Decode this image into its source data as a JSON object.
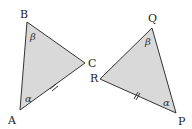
{
  "colors": {
    "fill": "#d9d9d9",
    "stroke": "#333333"
  },
  "triangles": [
    {
      "name": "ABC",
      "vertices": {
        "A": [
          20,
          110
        ],
        "B": [
          27,
          22
        ],
        "C": [
          85,
          63
        ]
      },
      "labels": {
        "A": "A",
        "B": "B",
        "C": "C"
      },
      "angles": {
        "B": "β",
        "A": "α"
      },
      "tick_side": "AC"
    },
    {
      "name": "PQR",
      "vertices": {
        "P": [
          176,
          113
        ],
        "Q": [
          152,
          28
        ],
        "R": [
          100,
          79
        ]
      },
      "labels": {
        "P": "P",
        "Q": "Q",
        "R": "R"
      },
      "angles": {
        "Q": "β",
        "P": "α"
      },
      "tick_side": "RP"
    }
  ]
}
